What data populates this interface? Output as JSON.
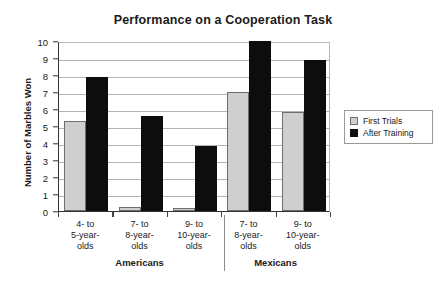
{
  "chart_data": {
    "type": "bar",
    "title": "Performance on a Cooperation Task",
    "xlabel": "",
    "ylabel": "Number of Marbles Won",
    "ylim": [
      0,
      10
    ],
    "yticks": [
      0,
      1,
      2,
      3,
      4,
      5,
      6,
      7,
      8,
      9,
      10
    ],
    "grid": true,
    "legend_position": "right",
    "categories": [
      "4- to 5-year-olds",
      "7- to 8-year-olds",
      "9- to 10-year-olds",
      "7- to 8-year-olds",
      "9- to 10-year-olds"
    ],
    "category_lines": [
      [
        "4- to",
        "5-year-",
        "olds"
      ],
      [
        "7- to",
        "8-year-",
        "olds"
      ],
      [
        "9- to",
        "10-year-",
        "olds"
      ],
      [
        "7- to",
        "8-year-",
        "olds"
      ],
      [
        "9- to",
        "10-year-",
        "olds"
      ]
    ],
    "groups": [
      {
        "label": "Americans",
        "categories": [
          0,
          1,
          2
        ]
      },
      {
        "label": "Mexicans",
        "categories": [
          3,
          4
        ]
      }
    ],
    "series": [
      {
        "name": "First Trials",
        "color": "#cfcfcf",
        "values": [
          5.3,
          0.25,
          0.2,
          7.0,
          5.8
        ]
      },
      {
        "name": "After Training",
        "color": "#0d0d0d",
        "values": [
          7.9,
          5.6,
          3.8,
          10.0,
          8.9
        ]
      }
    ]
  },
  "legend": {
    "items": [
      {
        "label": "First Trials"
      },
      {
        "label": "After Training"
      }
    ]
  }
}
